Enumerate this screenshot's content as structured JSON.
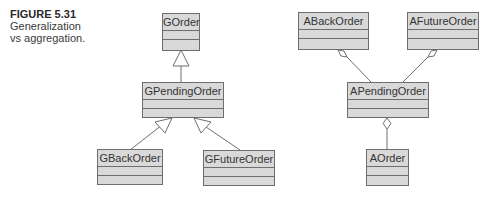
{
  "caption": {
    "figure": "FIGURE 5.31",
    "line1": "Generalization",
    "line2": "vs aggregation."
  },
  "generalization": {
    "classes": [
      {
        "id": "gorder",
        "name": "GOrder"
      },
      {
        "id": "gpendingorder",
        "name": "GPendingOrder"
      },
      {
        "id": "gbackorder",
        "name": "GBackOrder"
      },
      {
        "id": "gfutureorder",
        "name": "GFutureOrder"
      }
    ],
    "relations": [
      {
        "type": "generalization",
        "from": "GPendingOrder",
        "to": "GOrder"
      },
      {
        "type": "generalization",
        "from": "GBackOrder",
        "to": "GPendingOrder"
      },
      {
        "type": "generalization",
        "from": "GFutureOrder",
        "to": "GPendingOrder"
      }
    ]
  },
  "aggregation": {
    "classes": [
      {
        "id": "abackorder",
        "name": "ABackOrder"
      },
      {
        "id": "afutureorder",
        "name": "AFutureOrder"
      },
      {
        "id": "apendingorder",
        "name": "APendingOrder"
      },
      {
        "id": "aorder",
        "name": "AOrder"
      }
    ],
    "relations": [
      {
        "type": "aggregation",
        "whole": "ABackOrder",
        "part": "APendingOrder"
      },
      {
        "type": "aggregation",
        "whole": "AFutureOrder",
        "part": "APendingOrder"
      },
      {
        "type": "aggregation",
        "whole": "APendingOrder",
        "part": "AOrder"
      }
    ]
  },
  "colors": {
    "box_fill": "#d9d9d9",
    "box_border": "#6e6e6e",
    "line": "#6e6e6e"
  }
}
